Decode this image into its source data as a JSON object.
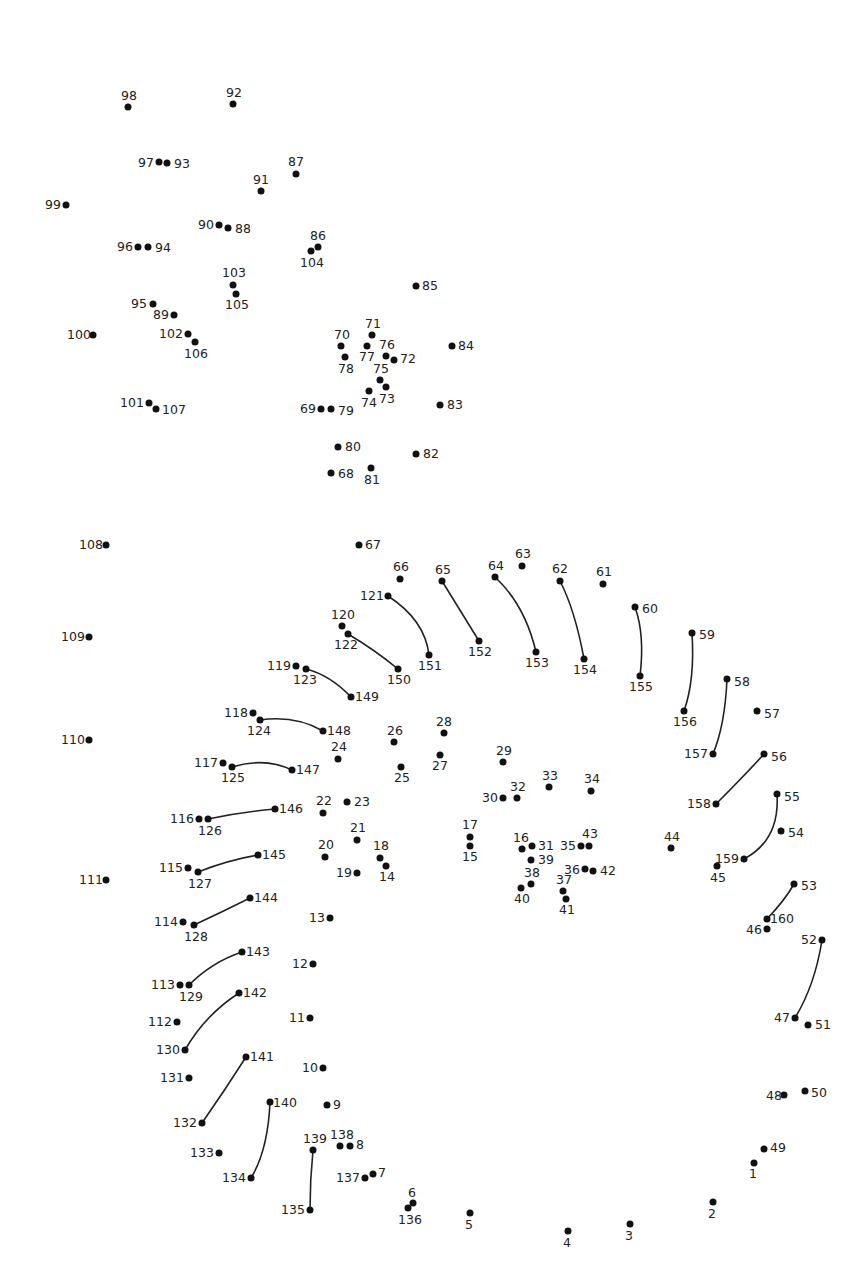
{
  "colors": {
    "dot": "#111111",
    "label": "#222222",
    "line": "#222222",
    "background": "#ffffff"
  },
  "dots": [
    {
      "n": "1",
      "x": 754,
      "y": 1163,
      "lx": 749,
      "ly": 1168
    },
    {
      "n": "2",
      "x": 713,
      "y": 1202,
      "lx": 708,
      "ly": 1208
    },
    {
      "n": "3",
      "x": 630,
      "y": 1224,
      "lx": 625,
      "ly": 1230
    },
    {
      "n": "4",
      "x": 568,
      "y": 1231,
      "lx": 563,
      "ly": 1237
    },
    {
      "n": "5",
      "x": 470,
      "y": 1213,
      "lx": 465,
      "ly": 1219
    },
    {
      "n": "6",
      "x": 413,
      "y": 1203,
      "lx": 408,
      "ly": 1187
    },
    {
      "n": "7",
      "x": 373,
      "y": 1174,
      "lx": 378,
      "ly": 1167
    },
    {
      "n": "8",
      "x": 350,
      "y": 1146,
      "lx": 356,
      "ly": 1139
    },
    {
      "n": "9",
      "x": 327,
      "y": 1105,
      "lx": 333,
      "ly": 1099
    },
    {
      "n": "10",
      "x": 323,
      "y": 1068,
      "lx": 302,
      "ly": 1062
    },
    {
      "n": "11",
      "x": 310,
      "y": 1018,
      "lx": 289,
      "ly": 1012
    },
    {
      "n": "12",
      "x": 313,
      "y": 964,
      "lx": 292,
      "ly": 958
    },
    {
      "n": "13",
      "x": 330,
      "y": 918,
      "lx": 309,
      "ly": 912
    },
    {
      "n": "14",
      "x": 386,
      "y": 866,
      "lx": 379,
      "ly": 871
    },
    {
      "n": "15",
      "x": 470,
      "y": 846,
      "lx": 462,
      "ly": 851
    },
    {
      "n": "16",
      "x": 522,
      "y": 849,
      "lx": 513,
      "ly": 832
    },
    {
      "n": "17",
      "x": 470,
      "y": 837,
      "lx": 462,
      "ly": 819
    },
    {
      "n": "18",
      "x": 380,
      "y": 858,
      "lx": 373,
      "ly": 840
    },
    {
      "n": "19",
      "x": 357,
      "y": 873,
      "lx": 336,
      "ly": 867
    },
    {
      "n": "20",
      "x": 325,
      "y": 857,
      "lx": 318,
      "ly": 839
    },
    {
      "n": "21",
      "x": 357,
      "y": 840,
      "lx": 350,
      "ly": 822
    },
    {
      "n": "22",
      "x": 323,
      "y": 813,
      "lx": 316,
      "ly": 795
    },
    {
      "n": "23",
      "x": 347,
      "y": 802,
      "lx": 354,
      "ly": 796
    },
    {
      "n": "24",
      "x": 338,
      "y": 759,
      "lx": 331,
      "ly": 741
    },
    {
      "n": "25",
      "x": 401,
      "y": 767,
      "lx": 394,
      "ly": 772
    },
    {
      "n": "26",
      "x": 394,
      "y": 742,
      "lx": 387,
      "ly": 725
    },
    {
      "n": "27",
      "x": 440,
      "y": 755,
      "lx": 432,
      "ly": 760
    },
    {
      "n": "28",
      "x": 444,
      "y": 733,
      "lx": 436,
      "ly": 716
    },
    {
      "n": "29",
      "x": 503,
      "y": 762,
      "lx": 496,
      "ly": 745
    },
    {
      "n": "30",
      "x": 503,
      "y": 798,
      "lx": 482,
      "ly": 792
    },
    {
      "n": "31",
      "x": 532,
      "y": 846,
      "lx": 538,
      "ly": 840
    },
    {
      "n": "32",
      "x": 517,
      "y": 798,
      "lx": 510,
      "ly": 781
    },
    {
      "n": "33",
      "x": 549,
      "y": 787,
      "lx": 542,
      "ly": 770
    },
    {
      "n": "34",
      "x": 591,
      "y": 791,
      "lx": 584,
      "ly": 773
    },
    {
      "n": "35",
      "x": 581,
      "y": 846,
      "lx": 560,
      "ly": 840
    },
    {
      "n": "36",
      "x": 585,
      "y": 869,
      "lx": 564,
      "ly": 864
    },
    {
      "n": "37",
      "x": 563,
      "y": 891,
      "lx": 556,
      "ly": 874
    },
    {
      "n": "38",
      "x": 531,
      "y": 884,
      "lx": 524,
      "ly": 867
    },
    {
      "n": "39",
      "x": 531,
      "y": 860,
      "lx": 538,
      "ly": 854
    },
    {
      "n": "40",
      "x": 521,
      "y": 888,
      "lx": 514,
      "ly": 893
    },
    {
      "n": "41",
      "x": 566,
      "y": 899,
      "lx": 559,
      "ly": 904
    },
    {
      "n": "42",
      "x": 593,
      "y": 871,
      "lx": 600,
      "ly": 865
    },
    {
      "n": "43",
      "x": 589,
      "y": 846,
      "lx": 582,
      "ly": 828
    },
    {
      "n": "44",
      "x": 671,
      "y": 848,
      "lx": 664,
      "ly": 831
    },
    {
      "n": "45",
      "x": 717,
      "y": 866,
      "lx": 710,
      "ly": 872
    },
    {
      "n": "46",
      "x": 767,
      "y": 929,
      "lx": 746,
      "ly": 924
    },
    {
      "n": "47",
      "x": 795,
      "y": 1018,
      "lx": 774,
      "ly": 1012
    },
    {
      "n": "48",
      "x": 784,
      "y": 1095,
      "lx": 766,
      "ly": 1090
    },
    {
      "n": "49",
      "x": 764,
      "y": 1149,
      "lx": 770,
      "ly": 1142
    },
    {
      "n": "50",
      "x": 805,
      "y": 1091,
      "lx": 811,
      "ly": 1087
    },
    {
      "n": "51",
      "x": 808,
      "y": 1025,
      "lx": 815,
      "ly": 1019
    },
    {
      "n": "52",
      "x": 822,
      "y": 940,
      "lx": 801,
      "ly": 934
    },
    {
      "n": "53",
      "x": 794,
      "y": 884,
      "lx": 801,
      "ly": 880
    },
    {
      "n": "54",
      "x": 781,
      "y": 831,
      "lx": 788,
      "ly": 827
    },
    {
      "n": "55",
      "x": 777,
      "y": 794,
      "lx": 784,
      "ly": 791
    },
    {
      "n": "56",
      "x": 764,
      "y": 754,
      "lx": 771,
      "ly": 751
    },
    {
      "n": "57",
      "x": 757,
      "y": 711,
      "lx": 764,
      "ly": 708
    },
    {
      "n": "58",
      "x": 727,
      "y": 679,
      "lx": 734,
      "ly": 676
    },
    {
      "n": "59",
      "x": 692,
      "y": 633,
      "lx": 699,
      "ly": 629
    },
    {
      "n": "60",
      "x": 635,
      "y": 607,
      "lx": 642,
      "ly": 603
    },
    {
      "n": "61",
      "x": 603,
      "y": 584,
      "lx": 596,
      "ly": 566
    },
    {
      "n": "62",
      "x": 560,
      "y": 581,
      "lx": 552,
      "ly": 563
    },
    {
      "n": "63",
      "x": 522,
      "y": 566,
      "lx": 515,
      "ly": 548
    },
    {
      "n": "64",
      "x": 495,
      "y": 577,
      "lx": 488,
      "ly": 560
    },
    {
      "n": "65",
      "x": 442,
      "y": 581,
      "lx": 435,
      "ly": 564
    },
    {
      "n": "66",
      "x": 400,
      "y": 579,
      "lx": 393,
      "ly": 561
    },
    {
      "n": "67",
      "x": 359,
      "y": 545,
      "lx": 365,
      "ly": 539
    },
    {
      "n": "68",
      "x": 331,
      "y": 473,
      "lx": 338,
      "ly": 468
    },
    {
      "n": "69",
      "x": 321,
      "y": 409,
      "lx": 300,
      "ly": 403
    },
    {
      "n": "70",
      "x": 341,
      "y": 346,
      "lx": 334,
      "ly": 329
    },
    {
      "n": "71",
      "x": 372,
      "y": 335,
      "lx": 365,
      "ly": 318
    },
    {
      "n": "72",
      "x": 394,
      "y": 360,
      "lx": 400,
      "ly": 353
    },
    {
      "n": "73",
      "x": 386,
      "y": 387,
      "lx": 379,
      "ly": 393
    },
    {
      "n": "74",
      "x": 369,
      "y": 391,
      "lx": 361,
      "ly": 397
    },
    {
      "n": "75",
      "x": 380,
      "y": 380,
      "lx": 373,
      "ly": 363
    },
    {
      "n": "76",
      "x": 386,
      "y": 356,
      "lx": 379,
      "ly": 339
    },
    {
      "n": "77",
      "x": 367,
      "y": 346,
      "lx": 359,
      "ly": 351
    },
    {
      "n": "78",
      "x": 345,
      "y": 357,
      "lx": 338,
      "ly": 363
    },
    {
      "n": "79",
      "x": 331,
      "y": 409,
      "lx": 338,
      "ly": 405
    },
    {
      "n": "80",
      "x": 338,
      "y": 447,
      "lx": 345,
      "ly": 441
    },
    {
      "n": "81",
      "x": 371,
      "y": 468,
      "lx": 364,
      "ly": 474
    },
    {
      "n": "82",
      "x": 416,
      "y": 454,
      "lx": 423,
      "ly": 448
    },
    {
      "n": "83",
      "x": 440,
      "y": 405,
      "lx": 447,
      "ly": 399
    },
    {
      "n": "84",
      "x": 452,
      "y": 346,
      "lx": 458,
      "ly": 340
    },
    {
      "n": "85",
      "x": 416,
      "y": 286,
      "lx": 422,
      "ly": 280
    },
    {
      "n": "86",
      "x": 318,
      "y": 247,
      "lx": 310,
      "ly": 230
    },
    {
      "n": "87",
      "x": 296,
      "y": 174,
      "lx": 288,
      "ly": 156
    },
    {
      "n": "88",
      "x": 228,
      "y": 228,
      "lx": 235,
      "ly": 223
    },
    {
      "n": "89",
      "x": 174,
      "y": 315,
      "lx": 153,
      "ly": 309
    },
    {
      "n": "90",
      "x": 219,
      "y": 225,
      "lx": 198,
      "ly": 219
    },
    {
      "n": "91",
      "x": 261,
      "y": 191,
      "lx": 253,
      "ly": 174
    },
    {
      "n": "92",
      "x": 233,
      "y": 104,
      "lx": 226,
      "ly": 87
    },
    {
      "n": "93",
      "x": 167,
      "y": 163,
      "lx": 174,
      "ly": 158
    },
    {
      "n": "94",
      "x": 148,
      "y": 247,
      "lx": 155,
      "ly": 242
    },
    {
      "n": "95",
      "x": 153,
      "y": 304,
      "lx": 131,
      "ly": 298
    },
    {
      "n": "96",
      "x": 138,
      "y": 247,
      "lx": 117,
      "ly": 241
    },
    {
      "n": "97",
      "x": 159,
      "y": 162,
      "lx": 138,
      "ly": 157
    },
    {
      "n": "98",
      "x": 128,
      "y": 107,
      "lx": 121,
      "ly": 90
    },
    {
      "n": "99",
      "x": 66,
      "y": 205,
      "lx": 45,
      "ly": 199
    },
    {
      "n": "100",
      "x": 93,
      "y": 335,
      "lx": 67,
      "ly": 329
    },
    {
      "n": "101",
      "x": 149,
      "y": 403,
      "lx": 120,
      "ly": 397
    },
    {
      "n": "102",
      "x": 188,
      "y": 334,
      "lx": 159,
      "ly": 328
    },
    {
      "n": "103",
      "x": 233,
      "y": 285,
      "lx": 222,
      "ly": 267
    },
    {
      "n": "104",
      "x": 311,
      "y": 251,
      "lx": 300,
      "ly": 257
    },
    {
      "n": "105",
      "x": 236,
      "y": 294,
      "lx": 225,
      "ly": 299
    },
    {
      "n": "106",
      "x": 195,
      "y": 342,
      "lx": 184,
      "ly": 348
    },
    {
      "n": "107",
      "x": 156,
      "y": 409,
      "lx": 162,
      "ly": 404
    },
    {
      "n": "108",
      "x": 106,
      "y": 545,
      "lx": 79,
      "ly": 539
    },
    {
      "n": "109",
      "x": 89,
      "y": 637,
      "lx": 61,
      "ly": 631
    },
    {
      "n": "110",
      "x": 89,
      "y": 740,
      "lx": 61,
      "ly": 734
    },
    {
      "n": "111",
      "x": 106,
      "y": 880,
      "lx": 79,
      "ly": 874
    },
    {
      "n": "112",
      "x": 177,
      "y": 1022,
      "lx": 148,
      "ly": 1016
    },
    {
      "n": "113",
      "x": 180,
      "y": 985,
      "lx": 151,
      "ly": 979
    },
    {
      "n": "114",
      "x": 183,
      "y": 922,
      "lx": 154,
      "ly": 916
    },
    {
      "n": "115",
      "x": 188,
      "y": 868,
      "lx": 159,
      "ly": 862
    },
    {
      "n": "116",
      "x": 199,
      "y": 819,
      "lx": 170,
      "ly": 813
    },
    {
      "n": "117",
      "x": 223,
      "y": 763,
      "lx": 194,
      "ly": 757
    },
    {
      "n": "118",
      "x": 253,
      "y": 713,
      "lx": 224,
      "ly": 707
    },
    {
      "n": "119",
      "x": 296,
      "y": 666,
      "lx": 267,
      "ly": 660
    },
    {
      "n": "120",
      "x": 342,
      "y": 626,
      "lx": 331,
      "ly": 609
    },
    {
      "n": "121",
      "x": 388,
      "y": 596,
      "lx": 360,
      "ly": 590
    },
    {
      "n": "122",
      "x": 348,
      "y": 634,
      "lx": 334,
      "ly": 639
    },
    {
      "n": "123",
      "x": 306,
      "y": 669,
      "lx": 293,
      "ly": 674
    },
    {
      "n": "124",
      "x": 260,
      "y": 720,
      "lx": 247,
      "ly": 725
    },
    {
      "n": "125",
      "x": 232,
      "y": 767,
      "lx": 221,
      "ly": 772
    },
    {
      "n": "126",
      "x": 208,
      "y": 819,
      "lx": 198,
      "ly": 825
    },
    {
      "n": "127",
      "x": 198,
      "y": 872,
      "lx": 188,
      "ly": 878
    },
    {
      "n": "128",
      "x": 194,
      "y": 925,
      "lx": 184,
      "ly": 931
    },
    {
      "n": "129",
      "x": 189,
      "y": 985,
      "lx": 179,
      "ly": 991
    },
    {
      "n": "130",
      "x": 185,
      "y": 1050,
      "lx": 156,
      "ly": 1044
    },
    {
      "n": "131",
      "x": 189,
      "y": 1078,
      "lx": 160,
      "ly": 1072
    },
    {
      "n": "132",
      "x": 202,
      "y": 1123,
      "lx": 173,
      "ly": 1117
    },
    {
      "n": "133",
      "x": 219,
      "y": 1153,
      "lx": 190,
      "ly": 1147
    },
    {
      "n": "134",
      "x": 251,
      "y": 1178,
      "lx": 222,
      "ly": 1172
    },
    {
      "n": "135",
      "x": 310,
      "y": 1210,
      "lx": 281,
      "ly": 1204
    },
    {
      "n": "136",
      "x": 408,
      "y": 1208,
      "lx": 398,
      "ly": 1214
    },
    {
      "n": "137",
      "x": 365,
      "y": 1178,
      "lx": 336,
      "ly": 1172
    },
    {
      "n": "138",
      "x": 340,
      "y": 1146,
      "lx": 330,
      "ly": 1129
    },
    {
      "n": "139",
      "x": 313,
      "y": 1150,
      "lx": 303,
      "ly": 1133
    },
    {
      "n": "140",
      "x": 270,
      "y": 1102,
      "lx": 273,
      "ly": 1097
    },
    {
      "n": "141",
      "x": 246,
      "y": 1057,
      "lx": 250,
      "ly": 1051
    },
    {
      "n": "142",
      "x": 239,
      "y": 993,
      "lx": 243,
      "ly": 987
    },
    {
      "n": "143",
      "x": 242,
      "y": 952,
      "lx": 246,
      "ly": 946
    },
    {
      "n": "144",
      "x": 250,
      "y": 898,
      "lx": 254,
      "ly": 892
    },
    {
      "n": "145",
      "x": 258,
      "y": 855,
      "lx": 262,
      "ly": 849
    },
    {
      "n": "146",
      "x": 275,
      "y": 809,
      "lx": 279,
      "ly": 803
    },
    {
      "n": "147",
      "x": 292,
      "y": 770,
      "lx": 296,
      "ly": 764
    },
    {
      "n": "148",
      "x": 323,
      "y": 731,
      "lx": 327,
      "ly": 725
    },
    {
      "n": "149",
      "x": 351,
      "y": 697,
      "lx": 355,
      "ly": 691
    },
    {
      "n": "150",
      "x": 398,
      "y": 669,
      "lx": 387,
      "ly": 674
    },
    {
      "n": "151",
      "x": 429,
      "y": 655,
      "lx": 418,
      "ly": 660
    },
    {
      "n": "152",
      "x": 479,
      "y": 641,
      "lx": 468,
      "ly": 646
    },
    {
      "n": "153",
      "x": 536,
      "y": 652,
      "lx": 525,
      "ly": 657
    },
    {
      "n": "154",
      "x": 584,
      "y": 659,
      "lx": 573,
      "ly": 664
    },
    {
      "n": "155",
      "x": 640,
      "y": 676,
      "lx": 629,
      "ly": 681
    },
    {
      "n": "156",
      "x": 684,
      "y": 711,
      "lx": 673,
      "ly": 716
    },
    {
      "n": "157",
      "x": 713,
      "y": 754,
      "lx": 684,
      "ly": 748
    },
    {
      "n": "158",
      "x": 716,
      "y": 804,
      "lx": 687,
      "ly": 798
    },
    {
      "n": "159",
      "x": 744,
      "y": 859,
      "lx": 715,
      "ly": 853
    },
    {
      "n": "160",
      "x": 767,
      "y": 919,
      "lx": 770,
      "ly": 913
    }
  ],
  "lines": [
    {
      "from": "121",
      "to": "151",
      "cx": 425,
      "cy": 620
    },
    {
      "from": "65",
      "to": "152",
      "cx": 460,
      "cy": 610
    },
    {
      "from": "64",
      "to": "153",
      "cx": 525,
      "cy": 605
    },
    {
      "from": "62",
      "to": "154",
      "cx": 575,
      "cy": 610
    },
    {
      "from": "60",
      "to": "155",
      "cx": 645,
      "cy": 635
    },
    {
      "from": "59",
      "to": "156",
      "cx": 695,
      "cy": 680
    },
    {
      "from": "58",
      "to": "157",
      "cx": 725,
      "cy": 725
    },
    {
      "from": "56",
      "to": "158",
      "cx": 745,
      "cy": 775
    },
    {
      "from": "55",
      "to": "159",
      "cx": 780,
      "cy": 840
    },
    {
      "from": "53",
      "to": "160",
      "cx": 785,
      "cy": 900
    },
    {
      "from": "52",
      "to": "47",
      "cx": 815,
      "cy": 985
    },
    {
      "from": "122",
      "to": "150",
      "cx": 375,
      "cy": 650
    },
    {
      "from": "123",
      "to": "149",
      "cx": 330,
      "cy": 675
    },
    {
      "from": "124",
      "to": "148",
      "cx": 295,
      "cy": 715
    },
    {
      "from": "125",
      "to": "147",
      "cx": 265,
      "cy": 757
    },
    {
      "from": "126",
      "to": "146",
      "cx": 240,
      "cy": 812
    },
    {
      "from": "127",
      "to": "145",
      "cx": 228,
      "cy": 860
    },
    {
      "from": "128",
      "to": "144",
      "cx": 222,
      "cy": 912
    },
    {
      "from": "129",
      "to": "143",
      "cx": 212,
      "cy": 962
    },
    {
      "from": "130",
      "to": "142",
      "cx": 205,
      "cy": 1015
    },
    {
      "from": "132",
      "to": "141",
      "cx": 225,
      "cy": 1090
    },
    {
      "from": "134",
      "to": "140",
      "cx": 268,
      "cy": 1150
    },
    {
      "from": "135",
      "to": "139",
      "cx": 310,
      "cy": 1180
    }
  ]
}
